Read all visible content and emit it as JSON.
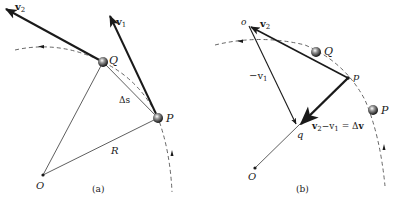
{
  "figure": {
    "panel_a": {
      "caption": "(a)",
      "labels": {
        "v2": "v",
        "v2_sub": "2",
        "v1": "v",
        "v1_sub": "1",
        "Q": "Q",
        "P": "P",
        "delta_s": "Δs",
        "R": "R",
        "O": "O"
      }
    },
    "panel_b": {
      "caption": "(b)",
      "labels": {
        "o": "o",
        "v2": "v",
        "v2_sub": "2",
        "Q": "Q",
        "p": "p",
        "neg_v1_prefix": "−v",
        "neg_v1_sub": "1",
        "P": "P",
        "q": "q",
        "O": "O",
        "dv_v2": "v",
        "dv_v2_sub": "2",
        "dv_minus": "−v",
        "dv_v1_sub": "1",
        "dv_eq": " = Δ",
        "dv_v": "v"
      }
    },
    "colors": {
      "ink": "#1a1a1a",
      "dashed": "#555555",
      "background": "#ffffff"
    }
  }
}
